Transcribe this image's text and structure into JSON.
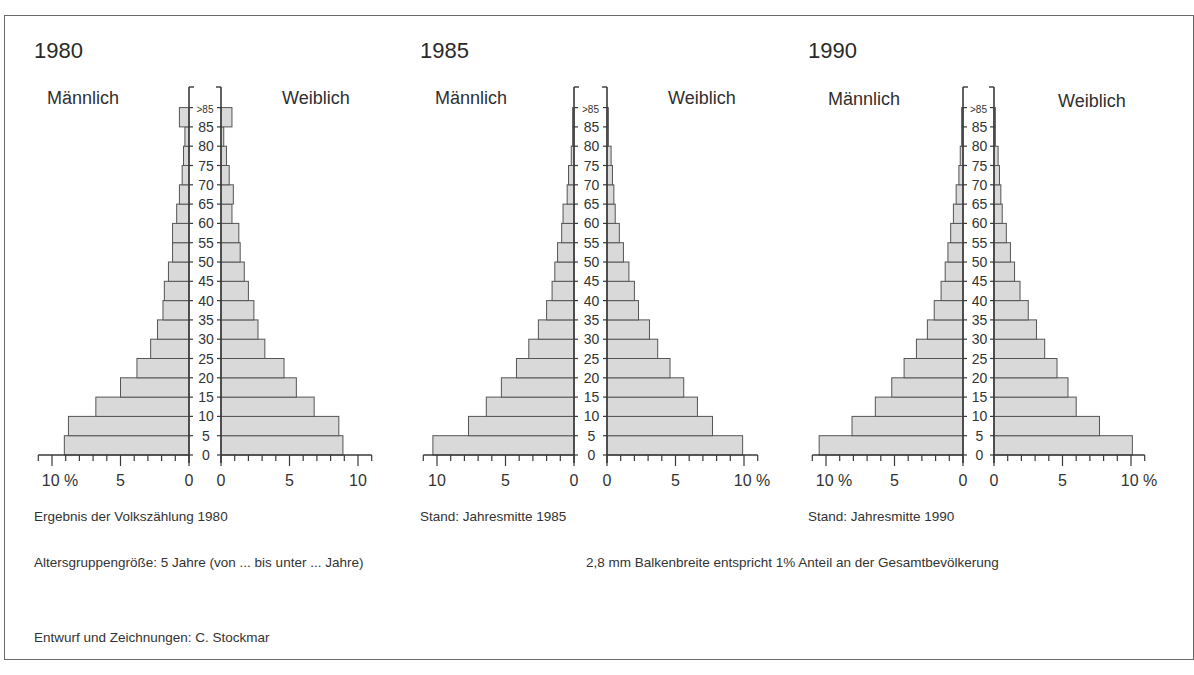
{
  "chart_data": [
    {
      "type": "bar",
      "subtype": "population-pyramid",
      "title": "1980",
      "left_label": "Männlich",
      "right_label": "Weiblich",
      "caption": "Ergebnis der Volkszählung 1980",
      "age_groups": [
        "0",
        "5",
        "10",
        "15",
        "20",
        "25",
        "30",
        "35",
        "40",
        "45",
        "50",
        "55",
        "60",
        "65",
        "70",
        "75",
        "80",
        "85"
      ],
      "age_tick_labels": [
        "0",
        "5",
        "10",
        "15",
        "20",
        "25",
        "30",
        "35",
        "40",
        "45",
        "50",
        "55",
        "60",
        "65",
        "70",
        "75",
        "80",
        "85",
        ">85"
      ],
      "categories": [
        "0-5",
        "5-10",
        "10-15",
        "15-20",
        "20-25",
        "25-30",
        "30-35",
        "35-40",
        "40-45",
        "45-50",
        "50-55",
        "55-60",
        "60-65",
        "65-70",
        "70-75",
        "75-80",
        "80-85",
        ">85"
      ],
      "series": [
        {
          "name": "Männlich",
          "values": [
            9.1,
            8.8,
            6.8,
            5.0,
            3.8,
            2.8,
            2.3,
            1.9,
            1.8,
            1.5,
            1.2,
            1.2,
            0.9,
            0.7,
            0.5,
            0.4,
            0.3,
            0.7
          ]
        },
        {
          "name": "Weiblich",
          "values": [
            8.9,
            8.6,
            6.8,
            5.5,
            4.6,
            3.2,
            2.7,
            2.4,
            2.0,
            1.7,
            1.4,
            1.3,
            0.8,
            0.9,
            0.6,
            0.4,
            0.2,
            0.8
          ]
        }
      ],
      "left_axis_ticks": [
        "10 %",
        "5",
        "0"
      ],
      "right_axis_ticks": [
        "0",
        "5",
        "10"
      ],
      "xlim": [
        0,
        11
      ],
      "unit": "%"
    },
    {
      "type": "bar",
      "subtype": "population-pyramid",
      "title": "1985",
      "left_label": "Männlich",
      "right_label": "Weiblich",
      "caption": "Stand: Jahresmitte 1985",
      "age_tick_labels": [
        "0",
        "5",
        "10",
        "15",
        "20",
        "25",
        "30",
        "35",
        "40",
        "45",
        "50",
        "55",
        "60",
        "65",
        "70",
        "75",
        "80",
        "85",
        ">85"
      ],
      "categories": [
        "0-5",
        "5-10",
        "10-15",
        "15-20",
        "20-25",
        "25-30",
        "30-35",
        "35-40",
        "40-45",
        "45-50",
        "50-55",
        "55-60",
        "60-65",
        "65-70",
        "70-75",
        "75-80",
        "80-85",
        ">85"
      ],
      "series": [
        {
          "name": "Männlich",
          "values": [
            10.3,
            7.7,
            6.4,
            5.3,
            4.2,
            3.3,
            2.6,
            2.0,
            1.6,
            1.4,
            1.2,
            0.9,
            0.8,
            0.5,
            0.4,
            0.2,
            0.1,
            0.1
          ]
        },
        {
          "name": "Weiblich",
          "values": [
            9.9,
            7.7,
            6.6,
            5.6,
            4.6,
            3.7,
            3.1,
            2.3,
            2.0,
            1.6,
            1.2,
            0.9,
            0.6,
            0.5,
            0.4,
            0.3,
            0.1,
            0.1
          ]
        }
      ],
      "left_axis_ticks": [
        "10",
        "5",
        "0"
      ],
      "right_axis_ticks": [
        "0",
        "5",
        "10 %"
      ],
      "xlim": [
        0,
        11
      ],
      "unit": "%"
    },
    {
      "type": "bar",
      "subtype": "population-pyramid",
      "title": "1990",
      "left_label": "Männlich",
      "right_label": "Weiblich",
      "caption": "Stand: Jahresmitte 1990",
      "age_tick_labels": [
        "0",
        "5",
        "10",
        "15",
        "20",
        "25",
        "30",
        "35",
        "40",
        "45",
        "50",
        "55",
        "60",
        "65",
        "70",
        "75",
        "80",
        "85",
        ">85"
      ],
      "categories": [
        "0-5",
        "5-10",
        "10-15",
        "15-20",
        "20-25",
        "25-30",
        "30-35",
        "35-40",
        "40-45",
        "45-50",
        "50-55",
        "55-60",
        "60-65",
        "65-70",
        "70-75",
        "75-80",
        "80-85",
        ">85"
      ],
      "series": [
        {
          "name": "Männlich",
          "values": [
            10.5,
            8.1,
            6.4,
            5.2,
            4.3,
            3.4,
            2.6,
            2.1,
            1.6,
            1.3,
            1.1,
            0.9,
            0.7,
            0.5,
            0.3,
            0.2,
            0.1,
            0.1
          ]
        },
        {
          "name": "Weiblich",
          "values": [
            10.1,
            7.7,
            6.0,
            5.4,
            4.6,
            3.7,
            3.1,
            2.5,
            1.9,
            1.5,
            1.2,
            0.9,
            0.6,
            0.5,
            0.4,
            0.3,
            0.1,
            0.1
          ]
        }
      ],
      "left_axis_ticks": [
        "10 %",
        "5",
        "0"
      ],
      "right_axis_ticks": [
        "0",
        "5",
        "10 %"
      ],
      "xlim": [
        0,
        11
      ],
      "unit": "%"
    }
  ],
  "notes": {
    "age_group_size": "Altersgruppengröße: 5 Jahre (von ... bis unter ... Jahre)",
    "scale": "2,8 mm Balkenbreite entspricht 1% Anteil an der Gesamtbevölkerung",
    "credit": "Entwurf und Zeichnungen: C. Stockmar"
  },
  "colors": {
    "bar_fill": "#d9d9d9",
    "bar_stroke": "#555555",
    "axis": "#3a3a3a",
    "frame": "#6a6a6a"
  }
}
